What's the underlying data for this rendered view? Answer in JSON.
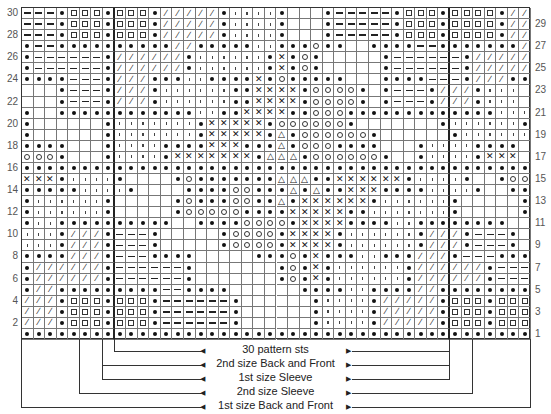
{
  "chart_data": {
    "type": "knitting-chart",
    "columns": 44,
    "rows": 30,
    "symbol_legend": {
      "o": "filled-dot",
      "-": "dash",
      "s": "square",
      "/": "slash",
      "'": "tick",
      "x": "cross",
      "c": "open-circle",
      "t": "triangle",
      ".": "blank"
    },
    "grid_top_to_bottom": [
      "---osssossso/////o''''o...o-----osssosssso///",
      "---osssossso/////o''''o...o-----osssosssso///",
      "---osssossso/////o''''o...o-----osssosssso///",
      "o--oooooooooo//ooooo''ooocoo..oooo--ooooooo//o",
      "o------o//////o''''''oxoco.....o------o//////o",
      "o------o//////o''''''oxoco.....o------o//////o",
      "oooo---o///ooo''ooooxocooooo...oooo---o///oooo",
      "...o---o///o''''''ooxxxxocccco.o---o///o'''",
      "...o---o///o''''''ooxxxxocccco.o---o///o'''",
      "o..oooooooooooo''ooxxxxoocccooooooooooooo'''o",
      "o......o'''''''oxxxxxocccccco.......o''''''o",
      "o......o'''''''oxxxxxotocccccco......o''''''o",
      "oooo...o''''ooooxxxoootocccoooo...o''''oooo",
      "ccco...o''''oxxxxxxxotttocccccco..o''''oxxx",
      "oooooooooooooooooooooooooooooooooooooooooooo",
      "xxxo''''o....ocoooooootttooxxxxxxo''''o..occc",
      "ooooo''''o....ooooccooototooxxxoooo''''o..oooo",
      "o''''''o.....ocoooccootoxxxxxxo''''''o.....o",
      "o''''''o.....occcccooooxxxxxoo'''''''o.....o",
      "o''oooooooooo..ooooccccoxxxxoooo''oooooooo..o",
      "'''o///o---o.....occccoxxxxo''''''o///o---o",
      "'''o///o---o.....occccoxxxxo''''''o///o---o",
      "oooo///o---oooo.....ooocoxooo''ooo///o---oooo",
      "o//////o------o.......ocoxo''''''o//////o------o",
      "o//////o------o.......ocoxo''''''o//////o------o",
      "o//ooooooooo--oooo......oooo''oooo//ooooooooo--o",
      "///osssossso------o......o''''o/////osssossso---",
      "///osssossso------o......o''''o/////osssossso---",
      "///osssossso------o......o''''o/////osssossso---",
      "oooooooooooooooooooooooooooooooooooooooooooo"
    ],
    "row_numbers_left": [
      30,
      28,
      26,
      24,
      22,
      20,
      18,
      16,
      14,
      12,
      10,
      8,
      6,
      4,
      2
    ],
    "row_numbers_right": [
      29,
      27,
      25,
      23,
      21,
      19,
      17,
      15,
      13,
      11,
      9,
      7,
      5,
      3,
      1
    ],
    "thick_column_lines_after": [
      8,
      37
    ],
    "brackets": [
      {
        "label": "30 pattern sts",
        "from_col": 8,
        "to_col": 37
      },
      {
        "label": "2nd size Back and Front",
        "from_col": 7,
        "to_col": 37
      },
      {
        "label": "1st size Sleeve",
        "from_col": 7,
        "to_col": 37
      },
      {
        "label": "2nd size Sleeve",
        "from_col": 5,
        "to_col": 39
      },
      {
        "label": "1st size Back and Front",
        "from_col": 0,
        "to_col": 44
      }
    ]
  },
  "labels": {
    "b0": "30 pattern sts",
    "b1": "2nd size Back and Front",
    "b2": "1st size Sleeve",
    "b3": "2nd size Sleeve",
    "b4": "1st size Back and Front"
  }
}
